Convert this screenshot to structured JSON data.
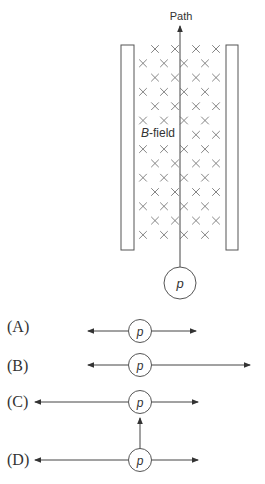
{
  "figure": {
    "path_label": "Path",
    "field_label": "B-field",
    "field_label_italic": "B",
    "field_label_rest": "-field",
    "particle_label": "p",
    "colors": {
      "stroke": "#555555",
      "cross": "#777777",
      "text": "#333333"
    }
  },
  "options": [
    {
      "label": "(A)",
      "particle": "p",
      "arrows": "left short, right short"
    },
    {
      "label": "(B)",
      "particle": "p",
      "arrows": "left short, right long"
    },
    {
      "label": "(C)",
      "particle": "p",
      "arrows": "left long, right short, up from below"
    },
    {
      "label": "(D)",
      "particle": "p",
      "arrows": "left long, right short"
    }
  ]
}
